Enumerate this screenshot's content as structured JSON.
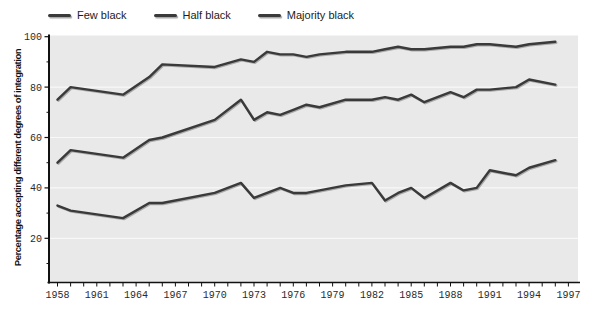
{
  "figure": {
    "bg_color": "#ffffff",
    "plot_bg_color": "#e9e9e9",
    "axis_color": "#111111",
    "grid_color": "#f8f8f8",
    "text_color": "#2b2b2b"
  },
  "legend": {
    "items": [
      {
        "label": "Few black",
        "swatch": "line-swatch",
        "color": "#3a3a3a"
      },
      {
        "label": "Half black",
        "swatch": "line-swatch",
        "color": "#3a3a3a"
      },
      {
        "label": "Majority black",
        "swatch": "line-swatch",
        "color": "#3a3a3a"
      }
    ]
  },
  "chart_data": {
    "type": "line",
    "title": "",
    "xlabel": "",
    "ylabel": "Percentage accepting different degrees of integration",
    "x_range": [
      1958,
      1997
    ],
    "ylim": [
      0,
      100
    ],
    "y_ticks": [
      20,
      40,
      60,
      80,
      100
    ],
    "y_minor_tick_step": 10,
    "x_tick_labels": [
      1958,
      1961,
      1964,
      1967,
      1970,
      1973,
      1976,
      1979,
      1982,
      1985,
      1988,
      1991,
      1994,
      1997
    ],
    "x_minor_tick_step": 1,
    "grid": true,
    "legend_position": "top-left",
    "x": [
      1958,
      1959,
      1963,
      1965,
      1966,
      1970,
      1972,
      1973,
      1974,
      1975,
      1976,
      1977,
      1978,
      1980,
      1982,
      1983,
      1984,
      1985,
      1986,
      1988,
      1989,
      1990,
      1991,
      1993,
      1994,
      1996
    ],
    "series": [
      {
        "name": "Few black",
        "color": "#3a3a3a",
        "values": [
          75,
          80,
          77,
          84,
          89,
          88,
          91,
          90,
          94,
          93,
          93,
          92,
          93,
          94,
          94,
          95,
          96,
          95,
          95,
          96,
          96,
          97,
          97,
          96,
          97,
          98
        ]
      },
      {
        "name": "Half black",
        "color": "#3a3a3a",
        "values": [
          50,
          55,
          52,
          59,
          60,
          67,
          75,
          67,
          70,
          69,
          71,
          73,
          72,
          75,
          75,
          76,
          75,
          77,
          74,
          78,
          76,
          79,
          79,
          80,
          83,
          81
        ]
      },
      {
        "name": "Majority black",
        "color": "#3a3a3a",
        "values": [
          33,
          31,
          28,
          34,
          34,
          38,
          42,
          36,
          38,
          40,
          38,
          38,
          39,
          41,
          42,
          35,
          38,
          40,
          36,
          42,
          39,
          40,
          47,
          45,
          48,
          51
        ]
      }
    ]
  }
}
